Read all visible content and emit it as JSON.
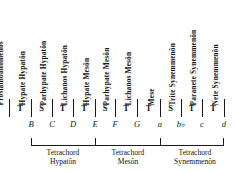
{
  "diagram": {
    "note_names": [
      "Proslambanomenos",
      "Hypate Hypatôn",
      "Parhypate Hypatôn",
      "Lichanos Hypatôn",
      "Hypate Mesôn",
      "Parhypate Mesôn",
      "Lichanos Mesôn",
      "Mese",
      "Trite Synemmenôn",
      "Paranete Synemmenôn",
      "Nete Synemmenôn"
    ],
    "intervals": [
      "T",
      "S",
      "T",
      "T",
      "S",
      "T",
      "T",
      "S",
      "T",
      "T"
    ],
    "pitches": [
      "",
      "B",
      "C",
      "D",
      "E",
      "F",
      "G",
      "a",
      "b♭",
      "c",
      "d"
    ],
    "pitch_letters": [
      "B",
      "C",
      "D",
      "E",
      "F",
      "G",
      "a",
      "b",
      "c",
      "d"
    ],
    "brackets": [
      {
        "line1": "Tetrachord",
        "line2": "Hypatôn"
      },
      {
        "line1": "Tetrachord",
        "line2": "Mesôn"
      },
      {
        "line1": "Tetrachord",
        "line2": "Synemmenôn"
      }
    ],
    "legend": {
      "tone": "T",
      "semitone": "S",
      "flat_symbol": "♭"
    },
    "colors": {
      "ink": "#141414",
      "rule": "#1a1a1a",
      "background": "#ffffff"
    }
  }
}
